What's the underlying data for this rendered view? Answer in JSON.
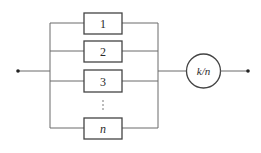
{
  "diagram": {
    "type": "reliability-block-diagram",
    "components": [
      {
        "label": "1",
        "italic": false
      },
      {
        "label": "2",
        "italic": false
      },
      {
        "label": "3",
        "italic": false
      },
      {
        "label": "n",
        "italic": true
      }
    ],
    "ellipsis": "⋮",
    "voter": {
      "label": "k/n",
      "italic": true
    },
    "terminals": [
      "input-node",
      "output-node"
    ],
    "colors": {
      "line": "#6a6a6a",
      "box_stroke": "#444444",
      "text": "#2a2a2a",
      "background": "#ffffff"
    }
  }
}
